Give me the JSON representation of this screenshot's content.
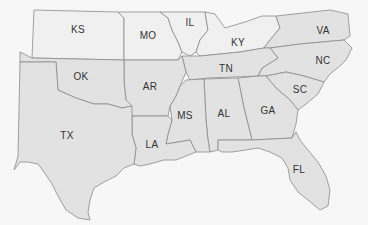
{
  "map": {
    "title": "Southeastern United States",
    "colors": {
      "background": "#f7f7f7",
      "highlighted_fill": "#e2e2e2",
      "context_fill": "#f0f0f0",
      "border": "#8a8a8a",
      "label": "#333333"
    },
    "highlighted_states": [
      "TX",
      "OK",
      "AR",
      "LA",
      "MS",
      "AL",
      "TN",
      "GA",
      "FL",
      "SC",
      "NC",
      "VA"
    ],
    "context_states": [
      "KS",
      "MO",
      "IL",
      "KY"
    ],
    "labels": [
      {
        "id": "KS",
        "text": "KS",
        "x": 78,
        "y": 29
      },
      {
        "id": "MO",
        "text": "MO",
        "x": 148,
        "y": 35
      },
      {
        "id": "IL",
        "text": "IL",
        "x": 190,
        "y": 22
      },
      {
        "id": "KY",
        "text": "KY",
        "x": 238,
        "y": 42
      },
      {
        "id": "VA",
        "text": "VA",
        "x": 323,
        "y": 30
      },
      {
        "id": "OK",
        "text": "OK",
        "x": 81,
        "y": 76
      },
      {
        "id": "AR",
        "text": "AR",
        "x": 150,
        "y": 86
      },
      {
        "id": "TN",
        "text": "TN",
        "x": 226,
        "y": 68
      },
      {
        "id": "NC",
        "text": "NC",
        "x": 323,
        "y": 60
      },
      {
        "id": "SC",
        "text": "SC",
        "x": 300,
        "y": 89
      },
      {
        "id": "MS",
        "text": "MS",
        "x": 185,
        "y": 115
      },
      {
        "id": "AL",
        "text": "AL",
        "x": 224,
        "y": 113
      },
      {
        "id": "GA",
        "text": "GA",
        "x": 268,
        "y": 110
      },
      {
        "id": "TX",
        "text": "TX",
        "x": 67,
        "y": 135
      },
      {
        "id": "LA",
        "text": "LA",
        "x": 152,
        "y": 144
      },
      {
        "id": "FL",
        "text": "FL",
        "x": 299,
        "y": 169
      }
    ]
  }
}
